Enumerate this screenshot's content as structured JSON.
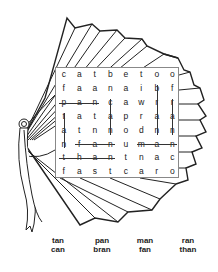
{
  "puzzle": {
    "title": "Word search on a hand fan",
    "grid": [
      [
        "c",
        "a",
        "t",
        "b",
        "e",
        "t",
        "o",
        "o"
      ],
      [
        "f",
        "a",
        "a",
        "n",
        "a",
        "i",
        "b",
        "f"
      ],
      [
        "p",
        "a",
        "n",
        "c",
        "a",
        "w",
        "r",
        "r"
      ],
      [
        "t",
        "a",
        "t",
        "a",
        "p",
        "r",
        "a",
        "a"
      ],
      [
        "a",
        "t",
        "n",
        "n",
        "o",
        "d",
        "n",
        "n"
      ],
      [
        "n",
        "f",
        "a",
        "n",
        "u",
        "m",
        "a",
        "n"
      ],
      [
        "t",
        "h",
        "a",
        "n",
        "t",
        "n",
        "a",
        "c"
      ],
      [
        "f",
        "a",
        "s",
        "t",
        "c",
        "a",
        "r",
        "o"
      ]
    ],
    "found_words": [
      {
        "word": "pan",
        "dir": "h",
        "row": 2,
        "col": 0,
        "len": 3
      },
      {
        "word": "fan",
        "dir": "h",
        "row": 5,
        "col": 1,
        "len": 3
      },
      {
        "word": "man",
        "dir": "h",
        "row": 5,
        "col": 5,
        "len": 3
      },
      {
        "word": "than",
        "dir": "h",
        "row": 6,
        "col": 0,
        "len": 4
      },
      {
        "word": "tan",
        "dir": "v",
        "row": 3,
        "col": 0,
        "len": 3
      },
      {
        "word": "can",
        "dir": "v",
        "row": 2,
        "col": 3,
        "len": 3
      },
      {
        "word": "bran",
        "dir": "v",
        "row": 1,
        "col": 6,
        "len": 4
      },
      {
        "word": "ran",
        "dir": "v",
        "row": 2,
        "col": 7,
        "len": 3
      }
    ]
  },
  "word_list": [
    {
      "label": "tan",
      "x": 58,
      "y": 0
    },
    {
      "label": "can",
      "x": 58,
      "y": 9
    },
    {
      "label": "pan",
      "x": 102,
      "y": 0
    },
    {
      "label": "bran",
      "x": 102,
      "y": 9
    },
    {
      "label": "man",
      "x": 145,
      "y": 0
    },
    {
      "label": "fan",
      "x": 145,
      "y": 9
    },
    {
      "label": "ran",
      "x": 188,
      "y": 0
    },
    {
      "label": "than",
      "x": 188,
      "y": 9
    }
  ],
  "colors": {
    "ink": "#222222",
    "background": "#ffffff",
    "grid_border": "#888888"
  }
}
